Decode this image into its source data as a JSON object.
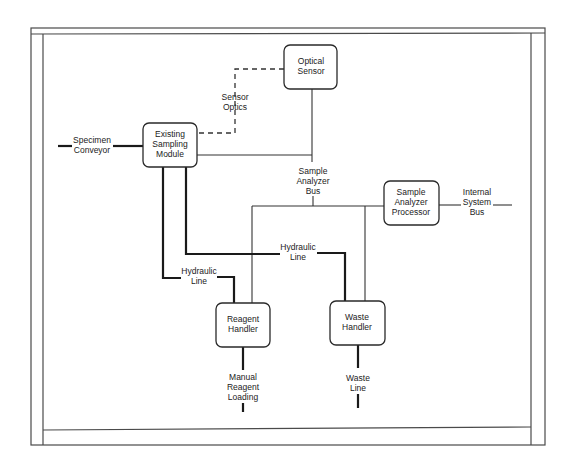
{
  "diagram": {
    "nodes": {
      "optical_sensor": {
        "line1": "Optical",
        "line2": "Sensor"
      },
      "sampling_module": {
        "line1": "Existing",
        "line2": "Sampling",
        "line3": "Module"
      },
      "processor": {
        "line1": "Sample",
        "line2": "Analyzer",
        "line3": "Processor"
      },
      "reagent_handler": {
        "line1": "Reagent",
        "line2": "Handler"
      },
      "waste_handler": {
        "line1": "Waste",
        "line2": "Handler"
      }
    },
    "edge_labels": {
      "sensor_optics": {
        "line1": "Sensor",
        "line2": "Optics"
      },
      "specimen_conveyor": {
        "line1": "Specimen",
        "line2": "Conveyor"
      },
      "sample_analyzer_bus": {
        "line1": "Sample",
        "line2": "Analyzer",
        "line3": "Bus"
      },
      "internal_system_bus": {
        "line1": "Internal",
        "line2": "System",
        "line3": "Bus"
      },
      "hydraulic_line_1": {
        "line1": "Hydraulic",
        "line2": "Line"
      },
      "hydraulic_line_2": {
        "line1": "Hydraulic",
        "line2": "Line"
      },
      "manual_reagent_loading": {
        "line1": "Manual",
        "line2": "Reagent",
        "line3": "Loading"
      },
      "waste_line": {
        "line1": "Waste",
        "line2": "Line"
      }
    },
    "colors": {
      "line": "#1a1a1a",
      "background": "#ffffff"
    }
  }
}
